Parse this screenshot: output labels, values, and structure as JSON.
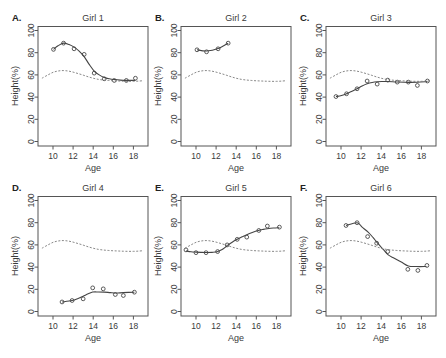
{
  "style": {
    "text_color": "#333333",
    "frame_color": "#555555",
    "observed_color": "#333333",
    "fitted_color": "#444444",
    "reference_color": "#7a7a7a"
  },
  "chart_data": [
    {
      "panel_label": "A.",
      "title": "Girl 1",
      "type": "line",
      "xlabel": "Age",
      "ylabel": "Height(%)",
      "xlim": [
        8.5,
        19.5
      ],
      "ylim": [
        -4,
        104
      ],
      "x_ticks": [
        10,
        12,
        14,
        16,
        18
      ],
      "y_ticks": [
        0,
        20,
        40,
        60,
        80,
        100
      ],
      "grid": false,
      "legend": null,
      "series": [
        {
          "name": "observed",
          "kind": "points",
          "marker": "open-circle",
          "x": [
            10.05,
            11.05,
            12.1,
            13.1,
            14.1,
            15.1,
            16.1,
            17.3,
            18.2
          ],
          "y": [
            83,
            88.6,
            83.5,
            78.5,
            61.6,
            56.5,
            55,
            55,
            57
          ]
        },
        {
          "name": "fitted",
          "kind": "line",
          "style": "solid",
          "x": [
            10.05,
            10.5,
            11.05,
            11.6,
            12.1,
            12.6,
            13.1,
            13.6,
            14.1,
            14.6,
            15.1,
            15.6,
            16.1,
            16.7,
            17.3,
            18.2
          ],
          "y": [
            83,
            86.2,
            88.6,
            87.3,
            85,
            81.5,
            76.5,
            69.5,
            63.5,
            60,
            57.7,
            56.5,
            55.8,
            55.3,
            55.1,
            55.1
          ]
        },
        {
          "name": "reference",
          "kind": "line",
          "style": "dashed",
          "x": [
            8.9,
            9.5,
            10,
            10.5,
            11,
            11.5,
            12,
            12.5,
            13,
            13.5,
            14,
            14.5,
            15,
            15.5,
            16,
            16.5,
            17,
            17.5,
            18,
            18.5,
            19
          ],
          "y": [
            57,
            60,
            62.3,
            63.5,
            63.9,
            63.5,
            62.5,
            61.2,
            59.8,
            58.3,
            57,
            56,
            55.4,
            55,
            54.7,
            54.5,
            54.3,
            54.2,
            54.2,
            54.4,
            54.8
          ]
        }
      ]
    },
    {
      "panel_label": "B.",
      "title": "Girl 2",
      "type": "line",
      "xlabel": "Age",
      "ylabel": "Height(%)",
      "xlim": [
        8.5,
        19.5
      ],
      "ylim": [
        -4,
        104
      ],
      "x_ticks": [
        10,
        12,
        14,
        16,
        18
      ],
      "y_ticks": [
        0,
        20,
        40,
        60,
        80,
        100
      ],
      "grid": false,
      "legend": null,
      "series": [
        {
          "name": "observed",
          "kind": "points",
          "marker": "open-circle",
          "x": [
            10.1,
            11.05,
            12.2,
            13.2
          ],
          "y": [
            82.6,
            80.8,
            83.5,
            88.6
          ]
        },
        {
          "name": "fitted",
          "kind": "line",
          "style": "solid",
          "x": [
            10.1,
            11.05,
            12.2,
            13.2
          ],
          "y": [
            82.6,
            81.5,
            83.7,
            88.6
          ]
        },
        {
          "name": "reference",
          "kind": "line",
          "style": "dashed",
          "x": [
            8.9,
            9.5,
            10,
            10.5,
            11,
            11.5,
            12,
            12.5,
            13,
            13.5,
            14,
            14.5,
            15,
            15.5,
            16,
            16.5,
            17,
            17.5,
            18,
            18.5,
            19
          ],
          "y": [
            57,
            60,
            62.3,
            63.5,
            63.9,
            63.5,
            62.5,
            61.2,
            59.8,
            58.3,
            57,
            56,
            55.4,
            55,
            54.7,
            54.5,
            54.3,
            54.2,
            54.2,
            54.4,
            54.8
          ]
        }
      ]
    },
    {
      "panel_label": "C.",
      "title": "Girl 3",
      "type": "line",
      "xlabel": "Age",
      "ylabel": "Height(%)",
      "xlim": [
        8.5,
        19.5
      ],
      "ylim": [
        -4,
        104
      ],
      "x_ticks": [
        10,
        12,
        14,
        16,
        18
      ],
      "y_ticks": [
        0,
        20,
        40,
        60,
        80,
        100
      ],
      "grid": false,
      "legend": null,
      "series": [
        {
          "name": "observed",
          "kind": "points",
          "marker": "open-circle",
          "x": [
            9.5,
            10.55,
            11.6,
            12.6,
            13.6,
            14.65,
            15.6,
            16.7,
            17.6,
            18.6
          ],
          "y": [
            40.5,
            43,
            47.5,
            54.5,
            51.7,
            55.3,
            53.5,
            53.5,
            50.5,
            54.5
          ]
        },
        {
          "name": "fitted",
          "kind": "line",
          "style": "solid",
          "x": [
            9.5,
            10.05,
            10.55,
            11.1,
            11.6,
            12.1,
            12.6,
            13.1,
            13.6,
            14.1,
            14.65,
            15.6,
            16.7,
            17.6,
            18.6
          ],
          "y": [
            40.5,
            41.5,
            43,
            45.3,
            47.5,
            50,
            52,
            53.2,
            53.8,
            54,
            54,
            53.6,
            53.3,
            53.4,
            54
          ]
        },
        {
          "name": "reference",
          "kind": "line",
          "style": "dashed",
          "x": [
            8.9,
            9.5,
            10,
            10.5,
            11,
            11.5,
            12,
            12.5,
            13,
            13.5,
            14,
            14.5,
            15,
            15.5,
            16,
            16.5,
            17,
            17.5,
            18,
            18.5,
            19
          ],
          "y": [
            57,
            60,
            62.3,
            63.5,
            63.9,
            63.5,
            62.5,
            61.2,
            59.8,
            58.3,
            57,
            56,
            55.4,
            55,
            54.7,
            54.5,
            54.3,
            54.2,
            54.2,
            54.4,
            54.8
          ]
        }
      ]
    },
    {
      "panel_label": "D.",
      "title": "Girl 4",
      "type": "line",
      "xlabel": "Age",
      "ylabel": "Height(%)",
      "xlim": [
        8.5,
        19.5
      ],
      "ylim": [
        -4,
        104
      ],
      "x_ticks": [
        10,
        12,
        14,
        16,
        18
      ],
      "y_ticks": [
        0,
        20,
        40,
        60,
        80,
        100
      ],
      "grid": false,
      "legend": null,
      "series": [
        {
          "name": "observed",
          "kind": "points",
          "marker": "open-circle",
          "x": [
            10.9,
            11.9,
            13.0,
            13.95,
            15.0,
            16.2,
            17.0,
            18.1
          ],
          "y": [
            8.6,
            9.9,
            11.4,
            21.3,
            20.4,
            15.3,
            14.4,
            17.4
          ]
        },
        {
          "name": "fitted",
          "kind": "line",
          "style": "solid",
          "x": [
            10.9,
            11.9,
            12.5,
            13.0,
            13.5,
            13.95,
            14.5,
            15.1,
            15.7,
            16.3,
            17.0,
            18.1
          ],
          "y": [
            8.6,
            9.9,
            11.8,
            13.8,
            15.9,
            17.5,
            17.6,
            17.5,
            17.0,
            16.6,
            17.0,
            17.4
          ]
        },
        {
          "name": "reference",
          "kind": "line",
          "style": "dashed",
          "x": [
            8.9,
            9.5,
            10,
            10.5,
            11,
            11.5,
            12,
            12.5,
            13,
            13.5,
            14,
            14.5,
            15,
            15.5,
            16,
            16.5,
            17,
            17.5,
            18,
            18.5,
            19
          ],
          "y": [
            57,
            60,
            62.3,
            63.5,
            63.9,
            63.5,
            62.5,
            61.2,
            59.8,
            58.3,
            57,
            56,
            55.4,
            55,
            54.7,
            54.5,
            54.3,
            54.2,
            54.2,
            54.4,
            54.8
          ]
        }
      ]
    },
    {
      "panel_label": "E.",
      "title": "Girl 5",
      "type": "line",
      "xlabel": "Age",
      "ylabel": "Height(%)",
      "xlim": [
        8.5,
        19.5
      ],
      "ylim": [
        -4,
        104
      ],
      "x_ticks": [
        10,
        12,
        14,
        16,
        18
      ],
      "y_ticks": [
        0,
        20,
        40,
        60,
        80,
        100
      ],
      "grid": false,
      "legend": null,
      "series": [
        {
          "name": "observed",
          "kind": "points",
          "marker": "open-circle",
          "x": [
            9.0,
            10.0,
            11.0,
            12.15,
            13.1,
            14.1,
            15.05,
            16.25,
            17.1,
            18.3
          ],
          "y": [
            55.5,
            53,
            53,
            54,
            60,
            65,
            67,
            73,
            77,
            76
          ]
        },
        {
          "name": "fitted",
          "kind": "line",
          "style": "solid",
          "x": [
            9.0,
            9.5,
            10.0,
            10.5,
            11.0,
            11.6,
            12.1,
            12.6,
            13.1,
            13.6,
            14.1,
            14.6,
            15.0,
            15.6,
            16.2,
            16.7,
            17.1,
            17.7,
            18.3
          ],
          "y": [
            54.5,
            53.8,
            53.5,
            53.3,
            53.2,
            53.3,
            53.8,
            55.8,
            59.3,
            62.4,
            65,
            67.3,
            69,
            71.2,
            73,
            74,
            74.6,
            75.2,
            75.5
          ]
        },
        {
          "name": "reference",
          "kind": "line",
          "style": "dashed",
          "x": [
            8.9,
            9.5,
            10,
            10.5,
            11,
            11.5,
            12,
            12.5,
            13,
            13.5,
            14,
            14.5,
            15,
            15.5,
            16,
            16.5,
            17,
            17.5,
            18,
            18.5,
            19
          ],
          "y": [
            57,
            60,
            62.3,
            63.5,
            63.9,
            63.5,
            62.5,
            61.2,
            59.8,
            58.3,
            57,
            56,
            55.4,
            55,
            54.7,
            54.5,
            54.3,
            54.2,
            54.2,
            54.4,
            54.8
          ]
        }
      ]
    },
    {
      "panel_label": "F.",
      "title": "Girl 6",
      "type": "line",
      "xlabel": "Age",
      "ylabel": "Height(%)",
      "xlim": [
        8.5,
        19.5
      ],
      "ylim": [
        -4,
        104
      ],
      "x_ticks": [
        10,
        12,
        14,
        16,
        18
      ],
      "y_ticks": [
        0,
        20,
        40,
        60,
        80,
        100
      ],
      "grid": false,
      "legend": null,
      "series": [
        {
          "name": "observed",
          "kind": "points",
          "marker": "open-circle",
          "x": [
            10.5,
            11.6,
            12.65,
            13.55,
            14.65,
            16.65,
            17.65,
            18.55
          ],
          "y": [
            77.5,
            80,
            67.5,
            61.5,
            54,
            38,
            37,
            41.5
          ]
        },
        {
          "name": "fitted",
          "kind": "line",
          "style": "solid",
          "x": [
            10.5,
            11.6,
            12.1,
            12.7,
            13.2,
            13.6,
            14.2,
            14.7,
            15.3,
            16.0,
            16.7,
            17.5,
            18.5
          ],
          "y": [
            77.5,
            80,
            76,
            71.5,
            66.5,
            62,
            56,
            51,
            48,
            44.5,
            41,
            40.5,
            40.5
          ]
        },
        {
          "name": "reference",
          "kind": "line",
          "style": "dashed",
          "x": [
            8.9,
            9.5,
            10,
            10.5,
            11,
            11.5,
            12,
            12.5,
            13,
            13.5,
            14,
            14.5,
            15,
            15.5,
            16,
            16.5,
            17,
            17.5,
            18,
            18.5,
            19
          ],
          "y": [
            57,
            60,
            62.3,
            63.5,
            63.9,
            63.5,
            62.5,
            61.2,
            59.8,
            58.3,
            57,
            56,
            55.4,
            55,
            54.7,
            54.5,
            54.3,
            54.2,
            54.2,
            54.4,
            54.8
          ]
        }
      ]
    }
  ]
}
